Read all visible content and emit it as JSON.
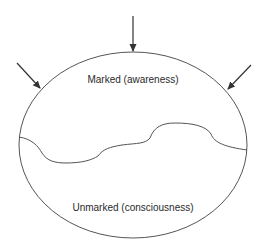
{
  "diagram": {
    "regions": {
      "marked": {
        "label": "Marked (awareness)"
      },
      "unmarked": {
        "label": "Unmarked (consciousness)"
      }
    },
    "arrows": [
      {
        "name": "arrow-top",
        "direction": "down"
      },
      {
        "name": "arrow-left",
        "direction": "down-right"
      },
      {
        "name": "arrow-right",
        "direction": "down-left"
      }
    ],
    "colors": {
      "stroke": "#555555",
      "arrow": "#333333",
      "text": "#2a2a2a"
    }
  }
}
